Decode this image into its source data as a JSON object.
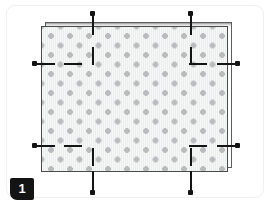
{
  "page": {
    "width": 272,
    "height": 205,
    "background": "#ffffff"
  },
  "card": {
    "border_color": "#f0f0f0",
    "radius": 9
  },
  "step": {
    "number": "1",
    "badge_bg": "#141414",
    "badge_text_color": "#ffffff"
  },
  "diagram": {
    "title": "",
    "panel": {
      "label": "perforated-panel",
      "fill": "#eceded",
      "border": "#4a4a4a",
      "dot_color": "#b9bbbd",
      "dot_spacing_px": 19,
      "dot_pattern": "staggered-grid"
    },
    "back_frame": {
      "label": "offset-frame",
      "border": "#5d5d5d",
      "offset_x_px": 4,
      "offset_y_px": -4
    },
    "markers": {
      "color": "#141414",
      "top": [
        {
          "name": "top-marker-left",
          "x": 92
        },
        {
          "name": "top-marker-right",
          "x": 190
        }
      ],
      "bottom": [
        {
          "name": "bottom-marker-left",
          "x": 92
        },
        {
          "name": "bottom-marker-right",
          "x": 190
        }
      ],
      "left": [
        {
          "name": "left-marker-upper",
          "y": 63
        },
        {
          "name": "left-marker-lower",
          "y": 145
        }
      ],
      "right": [
        {
          "name": "right-marker-upper",
          "y": 63
        },
        {
          "name": "right-marker-lower",
          "y": 145
        }
      ]
    }
  }
}
